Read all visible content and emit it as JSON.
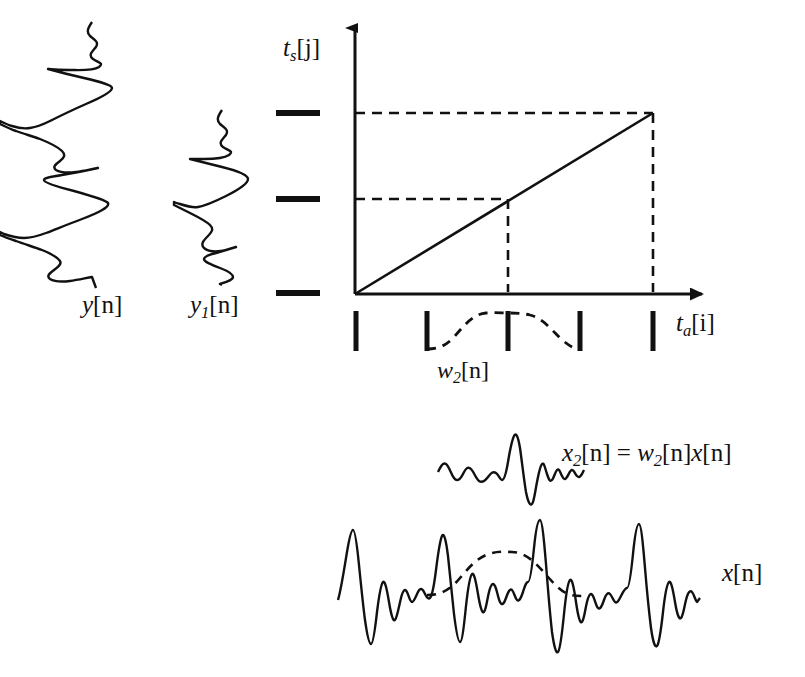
{
  "figure": {
    "axes": {
      "y_axis_label": "t_s[j]",
      "x_axis_label": "t_a[i]",
      "y_axis_label_parts": {
        "base": "t",
        "sub": "s",
        "index": "[j]"
      },
      "x_axis_label_parts": {
        "base": "t",
        "sub": "a",
        "index": "[i]"
      },
      "origin": {
        "x": 355,
        "y": 294
      },
      "x_axis_end": {
        "x": 715,
        "y": 294
      },
      "y_axis_top": {
        "x": 355,
        "y": 18
      },
      "arrowhead_style": "filled-triangle"
    },
    "mapping_line": {
      "type": "line",
      "from": {
        "x": 355,
        "y": 294
      },
      "to": {
        "x": 653,
        "y": 113
      },
      "style": "solid",
      "description": "linear time-warping map from analysis time to synthesis time"
    },
    "projection_lines": [
      {
        "name": "synthesis-tick-2-projection",
        "orientation": "horizontal",
        "y": 113,
        "from_x": 355,
        "to_x": 653,
        "style": "dashed"
      },
      {
        "name": "synthesis-tick-1-projection",
        "orientation": "horizontal",
        "y": 199,
        "from_x": 355,
        "to_x": 508,
        "style": "dashed"
      },
      {
        "name": "analysis-tick-3-projection",
        "orientation": "vertical",
        "x": 508,
        "from_y": 199,
        "to_y": 294,
        "style": "dashed"
      },
      {
        "name": "analysis-tick-5-projection",
        "orientation": "vertical",
        "x": 653,
        "from_y": 113,
        "to_y": 294,
        "style": "dashed"
      }
    ],
    "y_axis_ticks": [
      {
        "index": 0,
        "y": 113,
        "x_left": 276,
        "x_right": 320,
        "style": "thick-horizontal-dash"
      },
      {
        "index": 1,
        "y": 199,
        "x_left": 276,
        "x_right": 320,
        "style": "thick-horizontal-dash"
      },
      {
        "index": 2,
        "y": 293,
        "x_left": 276,
        "x_right": 320,
        "style": "thick-horizontal-dash"
      }
    ],
    "x_axis_ticks": [
      {
        "index": 0,
        "x": 356,
        "y_top": 311,
        "y_bottom": 351
      },
      {
        "index": 1,
        "x": 427,
        "y_top": 311,
        "y_bottom": 351
      },
      {
        "index": 2,
        "x": 508,
        "y_top": 311,
        "y_bottom": 351
      },
      {
        "index": 3,
        "x": 580,
        "y_top": 311,
        "y_bottom": 351
      },
      {
        "index": 4,
        "x": 653,
        "y_top": 311,
        "y_bottom": 351
      }
    ],
    "window": {
      "label": "w_2[n]",
      "label_parts": {
        "base": "w",
        "sub": "2",
        "index": "[n]"
      },
      "style": "dashed",
      "span_tick_from": 1,
      "span_tick_to": 3,
      "peak_x": 508,
      "shape": "raised-cosine (Hann) window over analysis ticks 2 through 4"
    },
    "signals": [
      {
        "name": "y",
        "label": "y[n]",
        "label_parts": {
          "base": "y",
          "sub": "",
          "index": "[n]"
        },
        "orientation": "vertical",
        "center_x": 98,
        "top_y": 22,
        "bottom_y": 288,
        "description": "synthesized output signal, drawn rotated 90 degrees"
      },
      {
        "name": "y1",
        "label": "y_1[n]",
        "label_parts": {
          "base": "y",
          "sub": "1",
          "index": "[n]"
        },
        "orientation": "vertical",
        "center_x": 222,
        "top_y": 110,
        "bottom_y": 285,
        "description": "first windowed synthesis frame, drawn rotated 90 degrees"
      },
      {
        "name": "x2",
        "label": "x_2[n] = w_2[n]x[n]",
        "equation_parts": {
          "lhs_base": "x",
          "lhs_sub": "2",
          "lhs_index": "[n]",
          "operator": " = ",
          "rhs1_base": "w",
          "rhs1_sub": "2",
          "rhs1_index": "[n]",
          "rhs2_base": "x",
          "rhs2_index": "[n]"
        },
        "orientation": "horizontal",
        "center_y": 470,
        "left_x": 438,
        "right_x": 560,
        "description": "windowed analysis frame 2"
      },
      {
        "name": "x",
        "label": "x[n]",
        "label_parts": {
          "base": "x",
          "sub": "",
          "index": "[n]"
        },
        "orientation": "horizontal",
        "center_y": 590,
        "left_x": 338,
        "right_x": 700,
        "description": "input signal with dashed window overlay"
      }
    ],
    "colors": {
      "stroke": "#111111",
      "background": "#ffffff"
    }
  }
}
